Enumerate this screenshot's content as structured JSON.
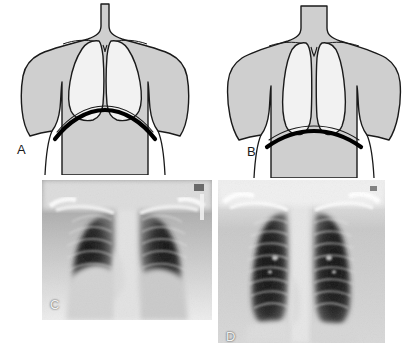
{
  "figure": {
    "background_color": "#ffffff",
    "width": 419,
    "height": 363,
    "panel_count": 4
  },
  "palette": {
    "body_fill": "#cfcfcf",
    "body_outline": "#1a1a1a",
    "lung_fill": "#f2f2f2",
    "lung_outline": "#1a1a1a",
    "diaphragm_stroke": "#000000",
    "label_color": "#1a1a1a",
    "xray_label_color": "#f2f2f2",
    "xray_background": "#e8e8e8",
    "xray_lung_dark": "#1c1c1c",
    "xray_bone_light": "#fafafa"
  },
  "panels": [
    {
      "id": "A",
      "label": "A",
      "type": "line-diagram",
      "subject": "normal chest",
      "description": "Anterior torso line drawing with broad rounded lungs and a strongly domed diaphragm",
      "diaphragm_shape": "domed",
      "lung_shape": "broad-rounded",
      "label_x": 17,
      "label_y": 149
    },
    {
      "id": "B",
      "label": "B",
      "type": "line-diagram",
      "subject": "hyperinflated chest",
      "description": "Anterior torso line drawing with narrow elongated lungs and a flattened diaphragm",
      "diaphragm_shape": "flattened",
      "lung_shape": "narrow-elongated",
      "label_x": 247,
      "label_y": 151
    },
    {
      "id": "C",
      "label": "C",
      "type": "radiograph",
      "subject": "normal chest radiograph",
      "description": "Frontal PA chest X-ray with normal lung fields and domed hemidiaphragms",
      "label_x": 50,
      "label_y": 302
    },
    {
      "id": "D",
      "label": "D",
      "type": "radiograph",
      "subject": "hyperinflated chest radiograph",
      "description": "Frontal PA chest X-ray showing tall narrow lung fields and flattened hemidiaphragms",
      "label_x": 226,
      "label_y": 330
    }
  ]
}
